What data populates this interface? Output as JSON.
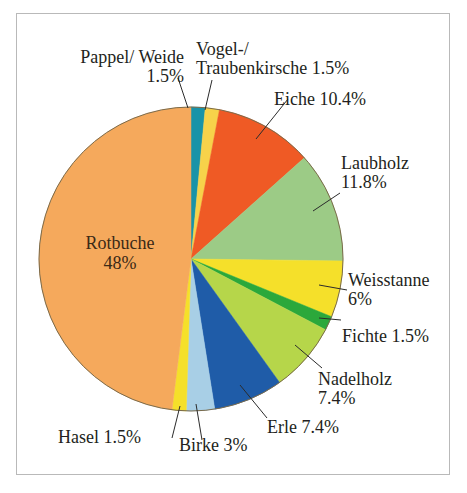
{
  "figure": {
    "title": "",
    "border_color": "#b9b9b9",
    "background": "#ffffff"
  },
  "chart_data": {
    "type": "pie",
    "title": "",
    "xlabel": "",
    "ylabel": "",
    "legend_position": "none",
    "grid": false,
    "units": "percent",
    "total": 100,
    "start_angle_deg": 0,
    "direction": "clockwise",
    "categories": [
      "Vogel-/Traubenkirsche",
      "Eiche",
      "Laubholz",
      "Weisstanne",
      "Fichte",
      "Nadelholz",
      "Erle",
      "Birke",
      "Hasel",
      "Rotbuche",
      "Pappel/ Weide"
    ],
    "values": [
      1.5,
      10.4,
      11.8,
      6,
      1.5,
      7.4,
      7.4,
      3,
      1.5,
      48,
      1.5
    ],
    "colors": [
      "#f7d24a",
      "#ef5a25",
      "#9ccb86",
      "#f5e02a",
      "#2ba83b",
      "#b6d64a",
      "#1f5ca8",
      "#a8cfe6",
      "#f5e02a",
      "#f5a95c",
      "#1993a8"
    ],
    "slices": [
      {
        "label": "Pappel/ Weide",
        "value": 1.5,
        "value_text": "1.5%",
        "color": "#1993a8"
      },
      {
        "label": "Vogel-/Traubenkirsche",
        "value": 1.5,
        "value_text": "1.5%",
        "color": "#f7d24a"
      },
      {
        "label": "Eiche",
        "value": 10.4,
        "value_text": "10.4%",
        "color": "#ef5a25"
      },
      {
        "label": "Laubholz",
        "value": 11.8,
        "value_text": "11.8%",
        "color": "#9ccb86"
      },
      {
        "label": "Weisstanne",
        "value": 6,
        "value_text": "6%",
        "color": "#f5e02a"
      },
      {
        "label": "Fichte",
        "value": 1.5,
        "value_text": "1.5%",
        "color": "#2ba83b"
      },
      {
        "label": "Nadelholz",
        "value": 7.4,
        "value_text": "7.4%",
        "color": "#b6d64a"
      },
      {
        "label": "Erle",
        "value": 7.4,
        "value_text": "7.4%",
        "color": "#1f5ca8"
      },
      {
        "label": "Birke",
        "value": 3,
        "value_text": "3%",
        "color": "#a8cfe6"
      },
      {
        "label": "Hasel",
        "value": 1.5,
        "value_text": "1.5%",
        "color": "#f5e02a"
      },
      {
        "label": "Rotbuche",
        "value": 48,
        "value_text": "48%",
        "color": "#f5a95c"
      }
    ]
  },
  "labels": {
    "pappel_weide_line1": "Pappel/ Weide",
    "pappel_weide_line2": "1.5%",
    "vogel_line1": "Vogel-/",
    "vogel_line2": "Traubenkirsche 1.5%",
    "eiche": "Eiche 10.4%",
    "laubholz_line1": "Laubholz",
    "laubholz_line2": "11.8%",
    "weisstanne_line1": "Weisstanne",
    "weisstanne_line2": "6%",
    "fichte": "Fichte 1.5%",
    "nadelholz_line1": "Nadelholz",
    "nadelholz_line2": "7.4%",
    "erle": "Erle 7.4%",
    "birke": "Birke 3%",
    "hasel": "Hasel 1.5%",
    "rotbuche_line1": "Rotbuche",
    "rotbuche_line2": "48%"
  }
}
